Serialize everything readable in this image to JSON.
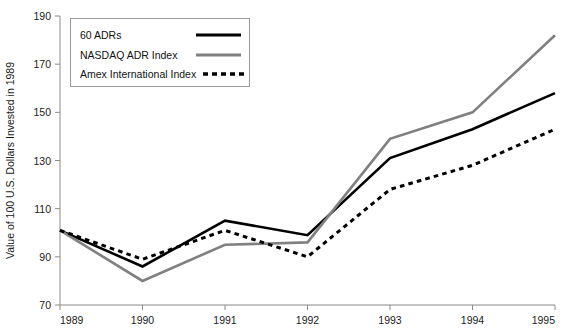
{
  "chart_data": {
    "type": "line",
    "title": "",
    "xlabel": "",
    "ylabel": "Value of 100 U.S. Dollars  Invested in 1989",
    "x": [
      1989,
      1990,
      1991,
      1992,
      1993,
      1994,
      1995
    ],
    "xtick_labels": [
      "1989",
      "1990",
      "1991",
      "1992",
      "1993",
      "1994",
      "1995"
    ],
    "ytick_labels": [
      "70",
      "90",
      "110",
      "130",
      "150",
      "170",
      "190"
    ],
    "yticks": [
      70,
      90,
      110,
      130,
      150,
      170,
      190
    ],
    "ylim": [
      70,
      190
    ],
    "xlim": [
      1989,
      1995
    ],
    "grid": false,
    "legend_position": "top-left",
    "series": [
      {
        "name": "60 ADRs",
        "values": [
          101,
          86,
          105,
          99,
          131,
          143,
          158
        ],
        "color": "#000000",
        "style": "solid",
        "width": 2.6
      },
      {
        "name": "NASDAQ ADR Index",
        "values": [
          101,
          80,
          95,
          96,
          139,
          150,
          182
        ],
        "color": "#808080",
        "style": "solid",
        "width": 2.6
      },
      {
        "name": "Amex International Index",
        "values": [
          101,
          89,
          101,
          90,
          118,
          128,
          143
        ],
        "color": "#000000",
        "style": "dotted",
        "width": 3.0
      }
    ]
  },
  "legend": {
    "items": [
      {
        "label": "60 ADRs"
      },
      {
        "label": "NASDAQ ADR Index"
      },
      {
        "label": "Amex International Index"
      }
    ]
  },
  "axes": {
    "y_title": "Value of 100 U.S. Dollars  Invested in 1989"
  },
  "colors": {
    "series_black": "#000000",
    "series_gray": "#808080",
    "axis": "#8a8a8a",
    "text": "#1a1a1a",
    "background": "#ffffff"
  }
}
